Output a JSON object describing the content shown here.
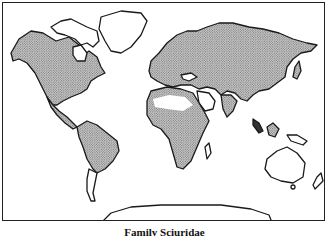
{
  "map": {
    "title": "Family Sciuridae",
    "legend": {
      "stippled": "range",
      "unstippled": "absent"
    },
    "colors": {
      "outline": "#1a1a1a",
      "stipple_dot": "#555555",
      "background": "#ffffff"
    },
    "regions_stippled": [
      "North America",
      "Central America",
      "South America (north)",
      "Europe",
      "Asia",
      "Africa (sub-Saharan)",
      "India",
      "Southeast Asia"
    ],
    "regions_unstippled": [
      "Greenland",
      "Arctic Canada islands",
      "Sahara",
      "Arabian Peninsula",
      "Southern South America",
      "Madagascar",
      "Australia",
      "New Zealand",
      "Antarctica"
    ]
  }
}
